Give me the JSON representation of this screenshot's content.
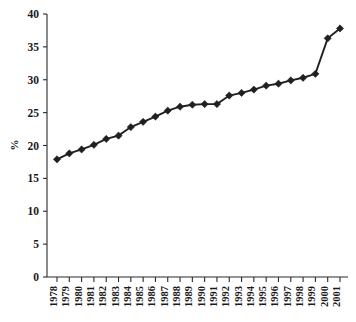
{
  "chart_data": {
    "type": "line",
    "title": "",
    "subtitle": "",
    "xlabel": "",
    "ylabel": "%",
    "categories": [
      "1978",
      "1979",
      "1980",
      "1981",
      "1982",
      "1983",
      "1984",
      "1985",
      "1986",
      "1987",
      "1988",
      "1989",
      "1990",
      "1991",
      "1992",
      "1993",
      "1994",
      "1995",
      "1996",
      "1997",
      "1998",
      "1999",
      "2000",
      "2001"
    ],
    "values": [
      17.9,
      18.8,
      19.4,
      20.1,
      21.0,
      21.5,
      22.8,
      23.6,
      24.4,
      25.3,
      25.9,
      26.2,
      26.3,
      26.3,
      27.6,
      28.0,
      28.5,
      29.1,
      29.4,
      29.9,
      30.3,
      30.9,
      36.3,
      37.8
    ],
    "series": [
      {
        "name": "%",
        "values": [
          17.9,
          18.8,
          19.4,
          20.1,
          21.0,
          21.5,
          22.8,
          23.6,
          24.4,
          25.3,
          25.9,
          26.2,
          26.3,
          26.3,
          27.6,
          28.0,
          28.5,
          29.1,
          29.4,
          29.9,
          30.3,
          30.9,
          36.3,
          37.8
        ]
      }
    ],
    "ylim": [
      0,
      40
    ],
    "yticks": [
      0,
      5,
      10,
      15,
      20,
      25,
      30,
      35,
      40
    ],
    "ytick_labels": [
      "0",
      "5",
      "10",
      "15",
      "20",
      "25",
      "30",
      "35",
      "40"
    ],
    "grid": false,
    "legend": false,
    "legend_position": "none",
    "marker": "diamond",
    "line_color": "#231f20",
    "marker_color": "#231f20",
    "axis_color": "#2a2a2a",
    "background_color": "#ffffff"
  }
}
